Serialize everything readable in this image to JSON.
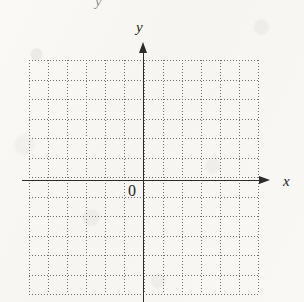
{
  "figure": {
    "kind": "cartesian-coordinate-grid",
    "width": 304,
    "height": 302,
    "background_color": "#f8f7f4",
    "ink_color": "#2b2b2b",
    "grid_color": "#6f6f6f"
  },
  "labels": {
    "x_axis": "x",
    "y_axis": "y",
    "origin": "0",
    "top_crop_artifact": "y"
  },
  "chart_data": {
    "type": "scatter",
    "title": "",
    "subtitle": "",
    "xlabel": "x",
    "ylabel": "y",
    "origin_label": "0",
    "grid": true,
    "grid_style": "dotted",
    "legend": "none",
    "series": [],
    "x": [],
    "values": [],
    "xlim": [
      -6,
      6
    ],
    "ylim": [
      -6,
      6
    ],
    "xticks": [
      -6,
      -5,
      -4,
      -3,
      -2,
      -1,
      0,
      1,
      2,
      3,
      4,
      5,
      6
    ],
    "yticks": [
      -6,
      -5,
      -4,
      -3,
      -2,
      -1,
      0,
      1,
      2,
      3,
      4,
      5,
      6
    ],
    "xtick_labels": [
      "",
      "",
      "",
      "",
      "",
      "",
      "0",
      "",
      "",
      "",
      "",
      "",
      ""
    ],
    "ytick_labels": [
      "",
      "",
      "",
      "",
      "",
      "",
      "",
      "",
      "",
      "",
      "",
      "",
      ""
    ],
    "columns": 12,
    "rows": 12,
    "annotations": []
  },
  "geometry": {
    "grid_left": 29,
    "grid_top": 60,
    "grid_right": 258,
    "grid_bottom": 294,
    "cell_width": 19.1,
    "cell_height": 19.5,
    "axis_x_y": 180,
    "axis_y_x": 143,
    "axis_x_start": 22,
    "axis_x_end": 268,
    "axis_y_top": 42,
    "axis_y_bottom": 302,
    "label_x_pos": [
      283,
      174
    ],
    "label_y_pos": [
      136,
      20
    ],
    "label_origin_pos": [
      128,
      183
    ],
    "artifact_pos": [
      95,
      -6
    ]
  }
}
